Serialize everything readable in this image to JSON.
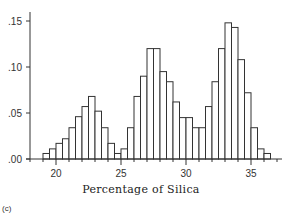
{
  "chart_data": {
    "type": "bar",
    "subtype": "histogram",
    "title": "",
    "panel_label": "(c)",
    "xlabel": "Percentage of Silica",
    "ylabel": "",
    "xlim": [
      18,
      37.5
    ],
    "ylim": [
      0,
      0.16
    ],
    "bin_width": 0.5,
    "bin_start": 19.0,
    "x_ticks": [
      20,
      25,
      30,
      35
    ],
    "x_tick_labels": [
      "20",
      "25",
      "30",
      "35"
    ],
    "y_ticks": [
      0.0,
      0.05,
      0.1,
      0.15
    ],
    "y_tick_labels": [
      ".00",
      ".05",
      ".10",
      ".15"
    ],
    "grid": false,
    "legend": null,
    "bins": [
      19.0,
      19.5,
      20.0,
      20.5,
      21.0,
      21.5,
      22.0,
      22.5,
      23.0,
      23.5,
      24.0,
      24.5,
      25.0,
      25.5,
      26.0,
      26.5,
      27.0,
      27.5,
      28.0,
      28.5,
      29.0,
      29.5,
      30.0,
      30.5,
      31.0,
      31.5,
      32.0,
      32.5,
      33.0,
      33.5,
      34.0,
      34.5,
      35.0,
      35.5,
      36.0
    ],
    "values": [
      0.006,
      0.011,
      0.017,
      0.022,
      0.034,
      0.046,
      0.057,
      0.068,
      0.052,
      0.034,
      0.017,
      0.006,
      0.011,
      0.034,
      0.068,
      0.09,
      0.12,
      0.12,
      0.095,
      0.084,
      0.062,
      0.045,
      0.045,
      0.034,
      0.034,
      0.057,
      0.084,
      0.12,
      0.148,
      0.143,
      0.108,
      0.072,
      0.034,
      0.011,
      0.006
    ]
  }
}
